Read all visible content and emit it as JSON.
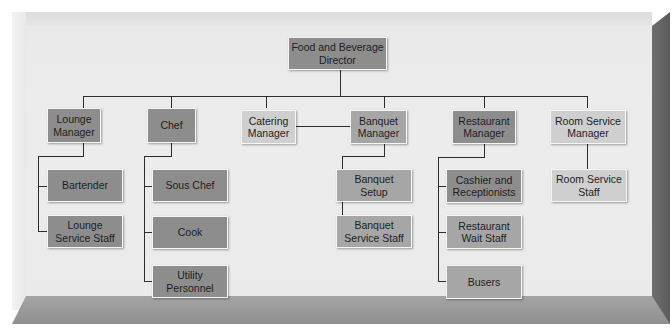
{
  "chart": {
    "title": "Food and Beverage Director",
    "root": {
      "label": "Food and Beverage\nDirector",
      "shade": "dark"
    },
    "managers": [
      {
        "label": "Lounge\nManager",
        "shade": "dark",
        "staff": [
          {
            "label": "Bartender"
          },
          {
            "label": "Lounge\nService Staff"
          }
        ]
      },
      {
        "label": "Chef",
        "shade": "dark",
        "staff": [
          {
            "label": "Sous Chef"
          },
          {
            "label": "Cook"
          },
          {
            "label": "Utility\nPersonnel"
          }
        ]
      },
      {
        "label": "Catering\nManager",
        "shade": "light",
        "staff": []
      },
      {
        "label": "Banquet\nManager",
        "shade": "mid",
        "staff": [
          {
            "label": "Banquet\nSetup"
          },
          {
            "label": "Banquet\nService Staff"
          }
        ]
      },
      {
        "label": "Restaurant\nManager",
        "shade": "dark",
        "staff": [
          {
            "label": "Cashier and\nReceptionists"
          },
          {
            "label": "Restaurant\nWait Staff"
          },
          {
            "label": "Busers"
          }
        ]
      },
      {
        "label": "Room Service\nManager",
        "shade": "light",
        "staff": [
          {
            "label": "Room Service\nStaff"
          }
        ]
      }
    ]
  },
  "colors": {
    "dark_box": "#8d8d8d",
    "mid_box": "#a6a6a6",
    "light_box": "#cfcfcf",
    "panel": "#eaeaea",
    "line": "#2c2c2c"
  }
}
